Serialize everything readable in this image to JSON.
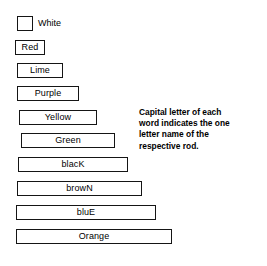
{
  "diagram": {
    "rods": [
      {
        "name": "white",
        "label": "White",
        "letter": "W",
        "length_units": 1,
        "box_width_px": 16,
        "left_px": 17,
        "top_px": 16,
        "label_inside": false
      },
      {
        "name": "red",
        "label": "Red",
        "letter": "R",
        "length_units": 2,
        "box_width_px": 30,
        "left_px": 15,
        "top_px": 40,
        "label_inside": true
      },
      {
        "name": "lime",
        "label": "Lime",
        "letter": "L",
        "length_units": 3,
        "box_width_px": 46,
        "left_px": 17,
        "top_px": 63,
        "label_inside": true
      },
      {
        "name": "purple",
        "label": "Purple",
        "letter": "P",
        "length_units": 4,
        "box_width_px": 62,
        "left_px": 17,
        "top_px": 86,
        "label_inside": true
      },
      {
        "name": "yellow",
        "label": "Yellow",
        "letter": "Y",
        "length_units": 5,
        "box_width_px": 78,
        "left_px": 19,
        "top_px": 110,
        "label_inside": true
      },
      {
        "name": "green",
        "label": "Green",
        "letter": "G",
        "length_units": 6,
        "box_width_px": 94,
        "left_px": 21,
        "top_px": 133,
        "label_inside": true
      },
      {
        "name": "black",
        "label": "blacK",
        "letter": "K",
        "length_units": 7,
        "box_width_px": 110,
        "left_px": 18,
        "top_px": 157,
        "label_inside": true
      },
      {
        "name": "brown",
        "label": "browN",
        "letter": "N",
        "length_units": 8,
        "box_width_px": 125,
        "left_px": 17,
        "top_px": 181,
        "label_inside": true
      },
      {
        "name": "blue",
        "label": "bluE",
        "letter": "E",
        "length_units": 9,
        "box_width_px": 140,
        "left_px": 16,
        "top_px": 205,
        "label_inside": true
      },
      {
        "name": "orange",
        "label": "Orange",
        "letter": "O",
        "length_units": 10,
        "box_width_px": 156,
        "left_px": 16,
        "top_px": 229,
        "label_inside": true
      }
    ],
    "note": {
      "text": "Capital letter of each word indicates the one letter name of the respective rod.",
      "lines": [
        "Capital letter of each",
        "word indicates the one",
        "letter name of the",
        "respective rod."
      ]
    },
    "colors": {
      "background": "#ffffff",
      "outline": "#151515",
      "text": "#000000"
    }
  }
}
